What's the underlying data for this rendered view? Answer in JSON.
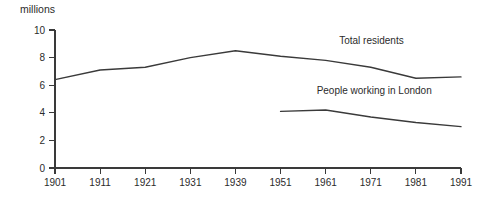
{
  "chart_data": {
    "type": "line",
    "title": "",
    "subtitle": "",
    "unit_label": "millions",
    "xlabel": "",
    "ylabel": "millions",
    "categories": [
      "1901",
      "1911",
      "1921",
      "1931",
      "1939",
      "1951",
      "1961",
      "1971",
      "1981",
      "1991"
    ],
    "x": [
      1901,
      1911,
      1921,
      1931,
      1939,
      1951,
      1961,
      1971,
      1981,
      1991
    ],
    "xlim": [
      1901,
      1991
    ],
    "ylim": [
      0,
      10
    ],
    "y_ticks": [
      "0",
      "2",
      "4",
      "6",
      "8",
      "10"
    ],
    "y_tick_values": [
      0,
      2,
      4,
      6,
      8,
      10
    ],
    "grid": false,
    "legend_position": "inline-annotation",
    "series": [
      {
        "name": "Total residents",
        "label": "Total residents",
        "x": [
          1901,
          1911,
          1921,
          1931,
          1939,
          1951,
          1961,
          1971,
          1981,
          1991
        ],
        "values": [
          6.4,
          7.1,
          7.3,
          8.0,
          8.5,
          8.1,
          7.8,
          7.3,
          6.5,
          6.6
        ],
        "color": "#3a3a3a"
      },
      {
        "name": "People working in London",
        "label": "People working in London",
        "x": [
          1951,
          1961,
          1971,
          1981,
          1991
        ],
        "values": [
          4.1,
          4.2,
          3.7,
          3.3,
          3.0
        ],
        "color": "#3a3a3a"
      }
    ],
    "annotations": [
      {
        "text": "Total residents",
        "x": 1964,
        "y": 9.0
      },
      {
        "text": "People working in London",
        "x": 1959,
        "y": 5.35
      }
    ]
  }
}
